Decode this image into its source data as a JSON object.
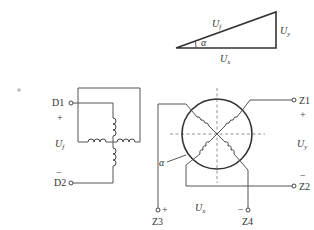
{
  "triangle": {
    "hypotenuse_label": "U",
    "hypotenuse_sub": "f",
    "vertical_label": "U",
    "vertical_sub": "y",
    "horizontal_label": "U",
    "horizontal_sub": "x",
    "angle_label": "α"
  },
  "excitation": {
    "terminal_top": "D1",
    "terminal_bottom": "D2",
    "plus_sign": "+",
    "minus_sign": "−",
    "voltage_label": "U",
    "voltage_sub": "f"
  },
  "rotor": {
    "angle_label": "α"
  },
  "outputs": {
    "z1": "Z1",
    "z2": "Z2",
    "z3": "Z3",
    "z4": "Z4",
    "uy_label": "U",
    "uy_sub": "y",
    "ux_label": "U",
    "ux_sub": "x",
    "z1_plus": "+",
    "z2_minus": "−",
    "z3_plus": "+",
    "z4_minus": "−"
  }
}
